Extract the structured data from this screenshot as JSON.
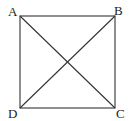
{
  "diagram": {
    "type": "square-with-diagonals",
    "vertices": [
      {
        "label": "A",
        "x": 20,
        "y": 16,
        "lx": 8,
        "ly": 16
      },
      {
        "label": "B",
        "x": 115,
        "y": 16,
        "lx": 114,
        "ly": 15
      },
      {
        "label": "C",
        "x": 115,
        "y": 108,
        "lx": 116,
        "ly": 118
      },
      {
        "label": "D",
        "x": 20,
        "y": 108,
        "lx": 8,
        "ly": 118
      }
    ],
    "sides": [
      "AB",
      "BC",
      "CD",
      "DA"
    ],
    "diagonals": [
      "AC",
      "BD"
    ],
    "colors": {
      "stroke": "#333333",
      "text": "#222222",
      "background": "#ffffff"
    }
  }
}
